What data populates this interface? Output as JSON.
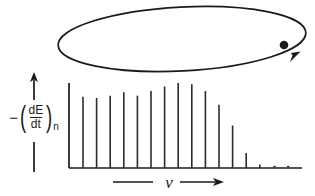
{
  "figure": {
    "axis_labels": {
      "y_minus": "−",
      "y_paren_open": "(",
      "y_numerator": "dE",
      "y_denominator": "dt",
      "y_paren_close": ")",
      "y_subscript": "n",
      "y_full": "-(dE/dt)n",
      "x_symbol": "ν",
      "x_full": "ν"
    },
    "colors": {
      "ink": "#1a1a1a",
      "bar": "#2b2b2b",
      "background": "#ffffff"
    },
    "orbit": {
      "name": "electron elliptical orbit",
      "center_x": 182,
      "center_y": 39,
      "radius_x": 124,
      "radius_y": 32,
      "rotation_deg": -3,
      "electron_dot": {
        "cx": 284,
        "cy": 45,
        "r": 4.2
      },
      "direction_arrow": {
        "tip_x": 297,
        "tip_y": 55,
        "angle_deg": -58
      }
    }
  },
  "chart_data": {
    "type": "bar",
    "xlabel": "ν",
    "ylabel": "-(dE/dt)n",
    "grid": false,
    "legend": null,
    "axis_style": "arrow-terminated axes, no tick labels",
    "categories": [
      "1",
      "2",
      "3",
      "4",
      "5",
      "6",
      "7",
      "8",
      "9",
      "10",
      "11",
      "12",
      "13",
      "14",
      "15",
      "16"
    ],
    "values": [
      62,
      61,
      63,
      66,
      63,
      67,
      71,
      74,
      73,
      67,
      55,
      37,
      13,
      3,
      0,
      0
    ],
    "ylim": [
      0,
      100
    ],
    "xlim": [
      0,
      17
    ]
  }
}
